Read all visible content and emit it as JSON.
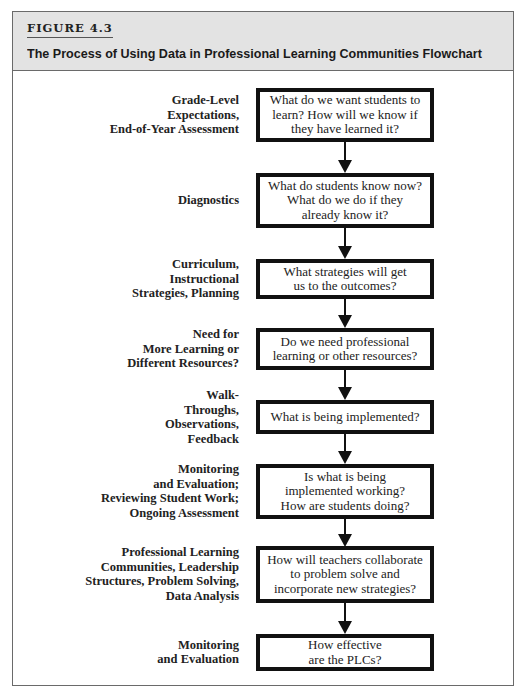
{
  "figure": {
    "label": "FIGURE 4.3",
    "title": "The Process of Using Data in Professional Learning Communities Flowchart"
  },
  "steps": [
    {
      "label": "Grade-Level\nExpectations,\nEnd-of-Year Assessment",
      "question": "What do we want students to\nlearn? How will we know if\nthey have learned it?"
    },
    {
      "label": "Diagnostics",
      "question": "What do students know now?\nWhat do we do if they\nalready know it?"
    },
    {
      "label": "Curriculum,\nInstructional\nStrategies, Planning",
      "question": "What strategies will get\nus to the outcomes?"
    },
    {
      "label": "Need for\nMore Learning or\nDifferent Resources?",
      "question": "Do we need professional\nlearning or other resources?"
    },
    {
      "label": "Walk-\nThroughs,\nObservations,\nFeedback",
      "question": "What is being implemented?"
    },
    {
      "label": "Monitoring\nand Evaluation;\nReviewing Student Work;\nOngoing Assessment",
      "question": "Is what is being\nimplemented working?\nHow are students doing?"
    },
    {
      "label": "Professional Learning\nCommunities, Leadership\nStructures, Problem Solving,\nData Analysis",
      "question": "How will teachers collaborate\nto problem solve and\nincorporate new strategies?"
    },
    {
      "label": "Monitoring\nand Evaluation",
      "question": "How effective\nare the PLCs?"
    }
  ],
  "colors": {
    "header_bg": "#e3e3e3",
    "border": "#111111",
    "frame": "#6a6a6a"
  }
}
